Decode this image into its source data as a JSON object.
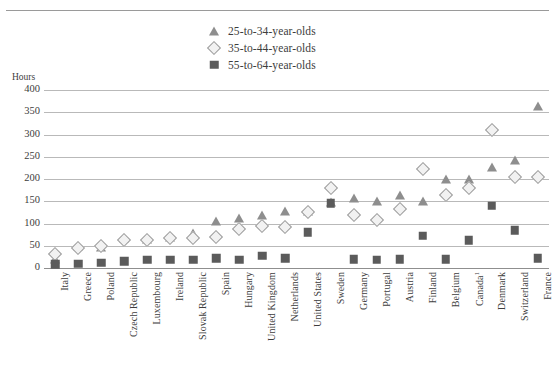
{
  "chart": {
    "title": "",
    "ylabel": "Hours",
    "type": "scatter"
  },
  "legend": {
    "position": "top-center",
    "items": [
      {
        "label": "25-to-34-year-olds",
        "marker": "triangle-marker",
        "color": "#8e8e8e"
      },
      {
        "label": "35-to-44-year-olds",
        "marker": "diamond-marker",
        "color": "#f2f2f2"
      },
      {
        "label": "55-to-64-year-olds",
        "marker": "square-marker",
        "color": "#5b5b5b"
      }
    ]
  },
  "yaxis": {
    "ticks": [
      "400",
      "350",
      "300",
      "250",
      "200",
      "150",
      "100",
      "50",
      "0"
    ],
    "min": 0,
    "max": 400,
    "step": 50
  },
  "chart_data": {
    "type": "scatter",
    "title": "",
    "xlabel": "",
    "ylabel": "Hours",
    "ylim": [
      0,
      400
    ],
    "grid": true,
    "legend_position": "top-center",
    "categories": [
      "Italy",
      "Greece",
      "Poland",
      "Czech Republic",
      "Luxembourg",
      "Ireland",
      "Slovak Republic",
      "Spain",
      "Hungary",
      "United Kingdom",
      "Netherlands",
      "United States",
      "Sweden",
      "Germany",
      "Portugal",
      "Austria",
      "Finland",
      "Belgium",
      "Canada",
      "Denmark",
      "Switzerland",
      "France"
    ],
    "category_notes": {
      "Canada": "1"
    },
    "series": [
      {
        "name": "25-to-34-year-olds",
        "marker": "triangle",
        "color": "#8e8e8e",
        "values": [
          20,
          50,
          48,
          68,
          65,
          70,
          78,
          105,
          113,
          120,
          128,
          128,
          148,
          158,
          150,
          165,
          150,
          200,
          200,
          228,
          243,
          365
        ]
      },
      {
        "name": "35-to-44-year-olds",
        "marker": "diamond",
        "color": "#f2f2f2",
        "values": [
          32,
          45,
          50,
          62,
          62,
          67,
          68,
          70,
          88,
          95,
          92,
          125,
          180,
          118,
          108,
          132,
          222,
          165,
          180,
          310,
          205,
          205
        ]
      },
      {
        "name": "55-to-64-year-olds",
        "marker": "square",
        "color": "#5b5b5b",
        "values": [
          8,
          10,
          12,
          15,
          18,
          18,
          18,
          22,
          18,
          28,
          22,
          80,
          145,
          20,
          18,
          20,
          72,
          20,
          62,
          140,
          85,
          22
        ]
      }
    ]
  }
}
